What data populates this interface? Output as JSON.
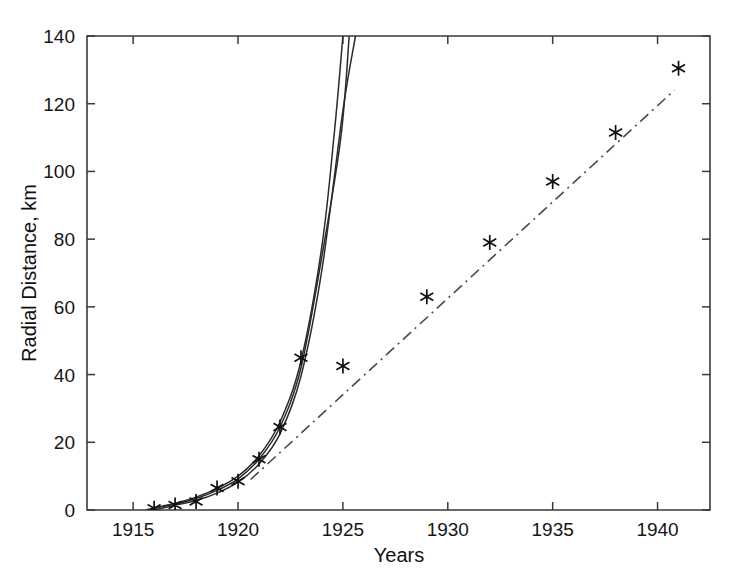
{
  "chart_data": {
    "type": "scatter",
    "title": "",
    "xlabel": "Years",
    "ylabel": "Radial Distance, km",
    "xlim": [
      1912.8,
      1942.5
    ],
    "ylim": [
      0,
      140
    ],
    "grid": false,
    "legend": "none",
    "xticks": [
      1915,
      1920,
      1925,
      1930,
      1935,
      1940
    ],
    "xticklabels": [
      "1915",
      "1920",
      "1925",
      "1930",
      "1935",
      "1940"
    ],
    "yticks": [
      0,
      20,
      40,
      60,
      80,
      100,
      120,
      140
    ],
    "yticklabels": [
      "0",
      "20",
      "40",
      "60",
      "80",
      "100",
      "120",
      "140"
    ],
    "series": [
      {
        "name": "observed-data",
        "type": "scatter",
        "marker": "asterisk",
        "color": "#111111",
        "x": [
          1916,
          1917,
          1918,
          1919,
          1920,
          1921,
          1922,
          1923,
          1925,
          1929,
          1932,
          1935,
          1938,
          1941
        ],
        "y": [
          0.5,
          1.5,
          2.5,
          6.5,
          8.5,
          15.0,
          24.5,
          45.0,
          42.5,
          63.0,
          79.0,
          97.0,
          111.5,
          130.5
        ]
      },
      {
        "name": "exponential-fit-lower",
        "type": "line",
        "style": "solid",
        "color": "#2b2b2b",
        "x": [
          1915.6,
          1916,
          1917,
          1918,
          1919,
          1920,
          1921,
          1922,
          1923,
          1924,
          1924.6,
          1925.0
        ],
        "y": [
          0.0,
          0.6,
          2.0,
          3.8,
          6.4,
          10.0,
          16.0,
          26.0,
          44.0,
          78.0,
          112.0,
          140.0
        ]
      },
      {
        "name": "exponential-fit-middle",
        "type": "line",
        "style": "solid",
        "color": "#2b2b2b",
        "x": [
          1915.8,
          1916,
          1917,
          1918,
          1919,
          1920,
          1921,
          1922,
          1923,
          1924,
          1924.9,
          1925.3
        ],
        "y": [
          0.0,
          0.5,
          1.8,
          3.4,
          5.8,
          9.2,
          15.0,
          24.5,
          42.0,
          75.0,
          110.0,
          140.0
        ]
      },
      {
        "name": "exponential-fit-upper",
        "type": "line",
        "style": "solid",
        "color": "#2b2b2b",
        "x": [
          1916.0,
          1917,
          1918,
          1919,
          1920,
          1921,
          1922,
          1923,
          1924,
          1925.0,
          1925.6
        ],
        "y": [
          0.0,
          1.4,
          2.8,
          5.0,
          8.2,
          13.6,
          22.5,
          39.5,
          71.0,
          118.0,
          140.0
        ]
      },
      {
        "name": "linear-trend",
        "type": "line",
        "style": "dash-dot",
        "color": "#4a4a4a",
        "x": [
          1920.6,
          1940.8
        ],
        "y": [
          9.0,
          124.0
        ]
      }
    ]
  }
}
